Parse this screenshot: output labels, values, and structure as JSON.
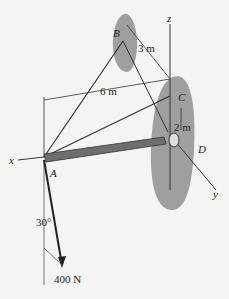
{
  "figure": {
    "points": {
      "A": "A",
      "B": "B",
      "C": "C",
      "D": "D"
    },
    "axes": {
      "x": "x",
      "y": "y",
      "z": "z"
    },
    "dimensions": {
      "BC": "3 m",
      "AC_horizontal": "6 m",
      "CD": "2 m"
    },
    "force": {
      "magnitude": "400 N",
      "angle": "30°"
    }
  },
  "colors": {
    "background": "#f4f4f2",
    "wall": "#8a8a8a",
    "boom": "#6e6e6e",
    "line": "#333333"
  }
}
